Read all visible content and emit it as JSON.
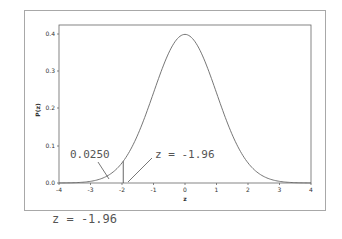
{
  "chart_data": {
    "type": "line",
    "title": "",
    "xlabel": "z",
    "ylabel": "P(z)",
    "xlim": [
      -4,
      4
    ],
    "ylim": [
      0,
      0.42
    ],
    "x_ticks": [
      "-4",
      "-3",
      "-2",
      "-1",
      "0",
      "1",
      "2",
      "3",
      "4"
    ],
    "y_ticks": [
      "0.0",
      "0.1",
      "0.2",
      "0.3",
      "0.4"
    ],
    "grid": false,
    "series": [
      {
        "name": "Standard normal density",
        "x": [
          -4,
          -3.5,
          -3,
          -2.5,
          -2,
          -1.5,
          -1,
          -0.5,
          0,
          0.5,
          1,
          1.5,
          2,
          2.5,
          3,
          3.5,
          4
        ],
        "values": [
          0.0001,
          0.0009,
          0.0044,
          0.0175,
          0.054,
          0.1295,
          0.242,
          0.3521,
          0.3989,
          0.3521,
          0.242,
          0.1295,
          0.054,
          0.0175,
          0.0044,
          0.0009,
          0.0001
        ]
      }
    ],
    "annotations": [
      {
        "text": "0.0250",
        "points_to": "left tail area below z = -1.96"
      },
      {
        "text": "z = -1.96",
        "points_to": "vertical line at z = -1.96"
      }
    ],
    "critical_value": -1.96,
    "tail_area": 0.025
  },
  "plot": {
    "y_axis_label": "P(z)",
    "x_axis_label": "z",
    "annotation_area": "0.0250",
    "annotation_z": "z = -1.96"
  },
  "caption": "z = -1.96"
}
